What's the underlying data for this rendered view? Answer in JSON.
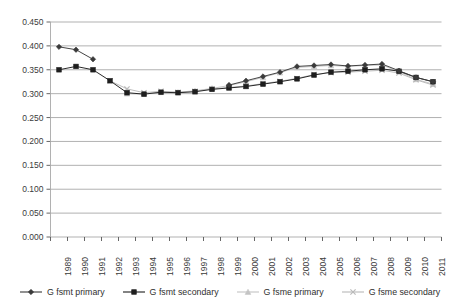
{
  "chart_data": {
    "type": "line",
    "title": "",
    "subtitle": "",
    "xlabel": "",
    "ylabel": "",
    "grid": true,
    "legend_position": "bottom",
    "ylim": [
      0.0,
      0.45
    ],
    "ytick_step": 0.05,
    "yticks": [
      "0.000",
      "0.050",
      "0.100",
      "0.150",
      "0.200",
      "0.250",
      "0.300",
      "0.350",
      "0.400",
      "0.450"
    ],
    "ytick_values": [
      0.0,
      0.05,
      0.1,
      0.15,
      0.2,
      0.25,
      0.3,
      0.35,
      0.4,
      0.45
    ],
    "categories": [
      "1989",
      "1990",
      "1991",
      "1992",
      "1993",
      "1994",
      "1995",
      "1996",
      "1997",
      "1998",
      "1999",
      "2000",
      "2001",
      "2002",
      "2003",
      "2004",
      "2005",
      "2006",
      "2007",
      "2008",
      "2009",
      "2010",
      "2011"
    ],
    "series": [
      {
        "name": "G fsmt primary",
        "marker": "diamond",
        "color": "#3a3a3a",
        "values": [
          0.398,
          0.392,
          0.372,
          null,
          null,
          null,
          null,
          null,
          null,
          null,
          0.318,
          0.327,
          0.336,
          0.345,
          0.357,
          0.359,
          0.361,
          0.358,
          0.36,
          0.362,
          0.348,
          0.334,
          0.325
        ]
      },
      {
        "name": "G fsmt secondary",
        "marker": "square",
        "color": "#1e1e1e",
        "values": [
          0.35,
          0.357,
          0.35,
          0.327,
          0.302,
          0.299,
          0.303,
          0.302,
          0.304,
          0.309,
          0.312,
          0.315,
          0.32,
          0.325,
          0.331,
          0.339,
          0.345,
          0.347,
          0.35,
          0.352,
          0.347,
          0.334,
          0.325
        ]
      },
      {
        "name": "G fsme primary",
        "marker": "triangle",
        "color": "#c4c4c4",
        "values": [
          null,
          null,
          null,
          null,
          0.3,
          0.299,
          0.303,
          0.303,
          0.306,
          0.311,
          0.317,
          0.325,
          0.334,
          0.344,
          0.355,
          0.357,
          0.359,
          0.357,
          0.359,
          0.36,
          0.346,
          0.33,
          0.32
        ]
      },
      {
        "name": "G fsme secondary",
        "marker": "x",
        "color": "#b9b9b9",
        "values": [
          null,
          null,
          null,
          0.327,
          0.31,
          0.302,
          0.305,
          0.303,
          0.305,
          0.31,
          0.313,
          0.316,
          0.321,
          0.326,
          0.332,
          0.34,
          0.344,
          0.345,
          0.347,
          0.349,
          0.343,
          0.329,
          0.318
        ]
      }
    ]
  },
  "axis": {
    "grid_color": "#a8a8a8",
    "tick_color": "#555555",
    "text_color": "#3b3b3b"
  },
  "legend": {
    "items": [
      {
        "label": "G fsmt primary",
        "marker": "diamond",
        "color": "#3a3a3a"
      },
      {
        "label": "G fsmt secondary",
        "marker": "square",
        "color": "#1e1e1e"
      },
      {
        "label": "G fsme primary",
        "marker": "triangle",
        "color": "#c4c4c4"
      },
      {
        "label": "G fsme secondary",
        "marker": "x",
        "color": "#b9b9b9"
      }
    ]
  }
}
